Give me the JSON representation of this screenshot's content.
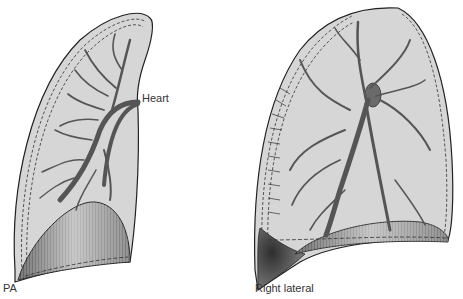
{
  "figure": {
    "type": "anatomical diagram",
    "panels": [
      {
        "id": "pa",
        "caption": "PA",
        "annotation": "Heart"
      },
      {
        "id": "lateral",
        "caption": "Right lateral"
      }
    ]
  },
  "colors": {
    "lung_fill": "#d6d6d6",
    "outline": "#222222",
    "vessel": "#555555",
    "diaphragm_dark": "#6a6a6a",
    "diaphragm_light": "#c8c8c8",
    "sulcus_dark": "#3a3a3a"
  }
}
